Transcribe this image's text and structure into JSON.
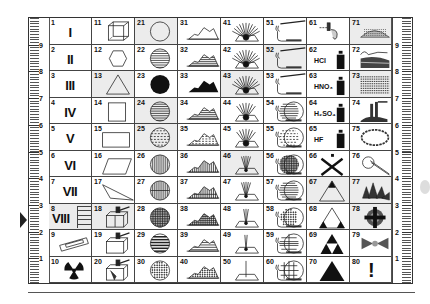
{
  "ruler": {
    "marks": [
      "9",
      "8",
      "7",
      "6",
      "5",
      "4",
      "3",
      "2",
      "1"
    ],
    "pointer_row": "8"
  },
  "cells": [
    {
      "n": "1",
      "label": "I",
      "kind": "roman"
    },
    {
      "n": "2",
      "label": "II",
      "kind": "roman"
    },
    {
      "n": "3",
      "label": "III",
      "kind": "roman"
    },
    {
      "n": "4",
      "label": "IV",
      "kind": "roman"
    },
    {
      "n": "5",
      "label": "V",
      "kind": "roman"
    },
    {
      "n": "6",
      "label": "VI",
      "kind": "roman"
    },
    {
      "n": "7",
      "label": "VII",
      "kind": "roman"
    },
    {
      "n": "8",
      "label": "VIII",
      "kind": "roman",
      "shade": true
    },
    {
      "n": "9",
      "icon": "slide-mount-icon"
    },
    {
      "n": "10",
      "icon": "radiation-icon"
    },
    {
      "n": "11",
      "icon": "cube-icon"
    },
    {
      "n": "12",
      "icon": "hexagon-icon"
    },
    {
      "n": "13",
      "icon": "triangle-icon",
      "shade": true
    },
    {
      "n": "14",
      "icon": "square-icon"
    },
    {
      "n": "15",
      "icon": "rectangle-icon"
    },
    {
      "n": "16",
      "icon": "parallelogram-icon"
    },
    {
      "n": "17",
      "icon": "obtuse-triangle-icon"
    },
    {
      "n": "18",
      "icon": "hammer-split-block-icon",
      "shade": true
    },
    {
      "n": "19",
      "icon": "hammer-block-icon"
    },
    {
      "n": "20",
      "icon": "hammer-broken-block-icon"
    },
    {
      "n": "21",
      "icon": "circle-icon",
      "shade": true
    },
    {
      "n": "22",
      "icon": "circle-h-lines-icon"
    },
    {
      "n": "23",
      "icon": "circle-filled-icon"
    },
    {
      "n": "24",
      "icon": "circle-h-lines-icon",
      "shade": true
    },
    {
      "n": "25",
      "icon": "circle-dashed-icon",
      "shade": true
    },
    {
      "n": "26",
      "icon": "circle-v-lines-icon"
    },
    {
      "n": "27",
      "icon": "circle-v-lines-split-icon"
    },
    {
      "n": "28",
      "icon": "circle-crosshatch-icon"
    },
    {
      "n": "29",
      "icon": "circle-thick-h-lines-icon"
    },
    {
      "n": "30",
      "icon": "circle-dotted-icon"
    },
    {
      "n": "31",
      "icon": "mountain-outline-icon"
    },
    {
      "n": "32",
      "icon": "mountain-h-lines-icon"
    },
    {
      "n": "33",
      "icon": "mountain-filled-icon"
    },
    {
      "n": "34",
      "icon": "mountain-h-lines-icon"
    },
    {
      "n": "35",
      "icon": "mountain-dashed-icon"
    },
    {
      "n": "36",
      "icon": "mountain-v-lines-icon"
    },
    {
      "n": "37",
      "icon": "mountain-v-lines-split-icon"
    },
    {
      "n": "38",
      "icon": "mountain-crosshatch-icon"
    },
    {
      "n": "39",
      "icon": "mountain-thick-h-lines-icon"
    },
    {
      "n": "40",
      "icon": "mountain-dotted-icon"
    },
    {
      "n": "41",
      "icon": "rays-dense-icon"
    },
    {
      "n": "42",
      "icon": "rays-dense-icon"
    },
    {
      "n": "43",
      "icon": "rays-dense-icon",
      "shade": true
    },
    {
      "n": "44",
      "icon": "rays-medium-icon"
    },
    {
      "n": "45",
      "icon": "rays-medium-icon"
    },
    {
      "n": "46",
      "icon": "rays-sparse-icon",
      "shade": true
    },
    {
      "n": "47",
      "icon": "rays-sparse-icon"
    },
    {
      "n": "48",
      "icon": "rays-few-icon"
    },
    {
      "n": "49",
      "icon": "rays-two-icon"
    },
    {
      "n": "50",
      "icon": "ray-single-icon"
    },
    {
      "n": "51",
      "icon": "burner-tube-icon"
    },
    {
      "n": "52",
      "icon": "burner-tube-icon",
      "shade": true
    },
    {
      "n": "53",
      "icon": "burner-tube-icon"
    },
    {
      "n": "54",
      "icon": "burner-circle-h-lines-icon"
    },
    {
      "n": "55",
      "icon": "burner-circle-dashed-icon"
    },
    {
      "n": "56",
      "icon": "burner-circle-crosshatch-icon"
    },
    {
      "n": "57",
      "icon": "burner-circle-h-lines-icon"
    },
    {
      "n": "58",
      "icon": "burner-circle-dotted-icon"
    },
    {
      "n": "59",
      "icon": "burner-circle-split-icon"
    },
    {
      "n": "60",
      "icon": "burner-circle-grid-icon"
    },
    {
      "n": "61",
      "icon": "dropper-bottle-icon"
    },
    {
      "n": "62",
      "icon": "acid-bottle-icon",
      "chem": "HCl"
    },
    {
      "n": "63",
      "icon": "acid-bottle-icon",
      "chem": "HNO₃"
    },
    {
      "n": "64",
      "icon": "acid-bottle-icon",
      "chem": "H₂SO₄"
    },
    {
      "n": "65",
      "icon": "acid-bottle-icon",
      "chem": "HF"
    },
    {
      "n": "66",
      "icon": "cross-bottle-icon"
    },
    {
      "n": "67",
      "icon": "triangle-top-filled-icon",
      "shade": true
    },
    {
      "n": "68",
      "icon": "triangle-corners-filled-icon"
    },
    {
      "n": "69",
      "icon": "triforce-icon"
    },
    {
      "n": "70",
      "icon": "triangle-filled-icon"
    },
    {
      "n": "71",
      "icon": "dotted-mound-icon",
      "shade": true
    },
    {
      "n": "72",
      "icon": "layered-rock-icon"
    },
    {
      "n": "73",
      "icon": "strata-block-icon",
      "shade": true
    },
    {
      "n": "74",
      "icon": "pipe-outcrop-icon"
    },
    {
      "n": "75",
      "icon": "ring-chain-icon"
    },
    {
      "n": "76",
      "icon": "loop-wire-icon"
    },
    {
      "n": "77",
      "icon": "crystal-cluster-icon",
      "shade": true
    },
    {
      "n": "78",
      "icon": "target-cross-icon",
      "shade": true
    },
    {
      "n": "79",
      "icon": "bowtie-cluster-icon"
    },
    {
      "n": "80",
      "icon": "exclamation-icon",
      "glyph": "!"
    }
  ]
}
